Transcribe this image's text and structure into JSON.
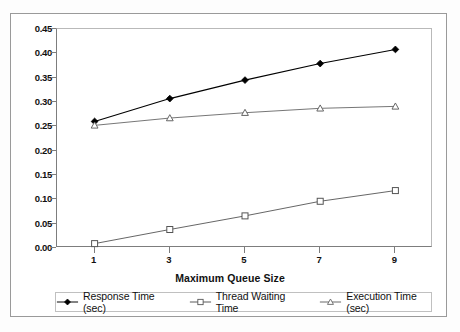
{
  "chart_data": {
    "type": "line",
    "title": "",
    "xlabel": "Maximum Queue Size",
    "ylabel": "",
    "categories": [
      1,
      3,
      5,
      7,
      9
    ],
    "x": [
      1,
      3,
      5,
      7,
      9
    ],
    "xtick_labels": [
      "1",
      "3",
      "5",
      "7",
      "9"
    ],
    "ytick_labels": [
      "0.00",
      "0.05",
      "0.10",
      "0.15",
      "0.20",
      "0.25",
      "0.30",
      "0.35",
      "0.40",
      "0.45"
    ],
    "ytick_values": [
      0.0,
      0.05,
      0.1,
      0.15,
      0.2,
      0.25,
      0.3,
      0.35,
      0.4,
      0.45
    ],
    "ylim": [
      0.0,
      0.45
    ],
    "xlim": [
      0,
      10
    ],
    "grid": false,
    "legend_position": "bottom",
    "series": [
      {
        "name": "Response Time (sec)",
        "marker": "filled-diamond",
        "color": "#000000",
        "values": [
          0.26,
          0.307,
          0.345,
          0.379,
          0.408
        ]
      },
      {
        "name": "Thread Waiting Time",
        "marker": "open-square",
        "color": "#555555",
        "values": [
          0.009,
          0.038,
          0.066,
          0.096,
          0.118
        ]
      },
      {
        "name": "Execution Time (sec)",
        "marker": "open-triangle",
        "color": "#666666",
        "values": [
          0.252,
          0.267,
          0.278,
          0.287,
          0.291
        ]
      }
    ]
  },
  "axis": {
    "x_title": "Maximum Queue Size"
  },
  "legend": {
    "items": [
      {
        "label": "Response Time (sec)",
        "marker": "filled-diamond"
      },
      {
        "label": "Thread Waiting Time",
        "marker": "open-square"
      },
      {
        "label": "Execution Time (sec)",
        "marker": "open-triangle"
      }
    ]
  }
}
